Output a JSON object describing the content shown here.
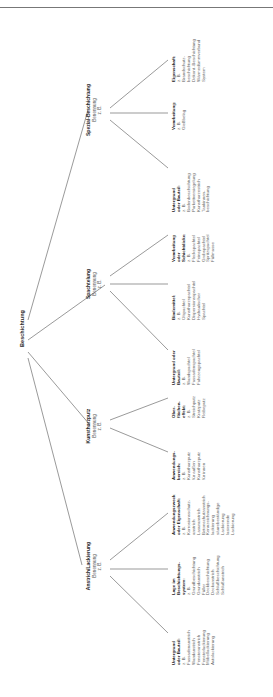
{
  "diagram": {
    "root": "Beschichtung",
    "label_designation": "Benennung",
    "label_eg": "z. B.",
    "categories": [
      {
        "title": "Spezial-Beschichtung",
        "children": [
          {
            "heading": [
              "Untergrund",
              "oder Bauteil:"
            ],
            "items": [
              "Bodenbeschichtung",
              "Parkettversiegelung",
              "Kunstharzestrich",
              "Tankinnen-",
              "beschichtung"
            ]
          },
          {
            "heading": [
              "Verarbeitung:"
            ],
            "items": [
              "Gießbelag"
            ]
          },
          {
            "heading": [
              "Eigenschaft:"
            ],
            "items": [
              "Brandschutz-",
              "beschichtung",
              "Dekont.-Beschichtung",
              "Wärmedämmverbund",
              "System"
            ]
          }
        ]
      },
      {
        "title": "Spachtelung",
        "children": [
          {
            "heading": [
              "Untergrund oder",
              "Bauteil:"
            ],
            "items": [
              "Wandspachtel",
              "Fassadenspachtel",
              "Fahrzeugspachtel"
            ]
          },
          {
            "heading": [
              "Bindemittel:"
            ],
            "items": [
              "Ölspachtel",
              "Kunstharzspachtel",
              "Dispersionsspachtel",
              "Hydraulischer",
              "Spachtel"
            ]
          },
          {
            "heading": [
              "Verarbeitung",
              "oder",
              "Schichtdicke:"
            ],
            "items": [
              "Fleckspachtel",
              "Feinspachtel",
              "Grobspachtel",
              "Spritzspachtel",
              "Füllmasse"
            ]
          }
        ]
      },
      {
        "title": "Kunstharzputz",
        "children": [
          {
            "heading": [
              "Anwendungs-",
              "bereich:"
            ],
            "items": [
              "Kunstharzputz",
              "für außen",
              "Kunstharzputz",
              "für innen"
            ]
          },
          {
            "heading": [
              "Ober-",
              "flächen-",
              "effekt:"
            ],
            "items": [
              "Streichputz",
              "Kratzputz",
              "Reibeputz"
            ]
          }
        ]
      },
      {
        "title": "Anstrich/Lackierung",
        "children": [
          {
            "heading": [
              "Untergrund",
              "oder Bauteil:"
            ],
            "items": [
              "Fassadenanstrich",
              "Wandanstrich",
              "Fensteranstrich",
              "Fensterlackierung",
              "Möbellackierung",
              "Autolackierung"
            ]
          },
          {
            "heading": [
              "Lage im",
              "Beschichtungs-",
              "system:"
            ],
            "items": [
              "Grundbeschichtung",
              "Grundanstrich",
              "Füller",
              "Deckbeschichtung",
              "Deckanstrich",
              "Schlußbeschichtung",
              "Schlußanstrich"
            ]
          },
          {
            "heading": [
              "Anwendungszweck",
              "oder Eigenschaft:"
            ],
            "items": [
              "Korrosionsschutz-",
              "anstrich",
              "Lasuranstrich",
              "Betonschutzanstrich",
              "Kennzeichnungs-",
              "lackierung",
              "säurebeständige",
              "Lackierung",
              "lasierende",
              "Lackierung"
            ]
          }
        ]
      }
    ],
    "colors": {
      "line": "#555555",
      "text": "#2a2a2a",
      "background": "#ffffff"
    }
  }
}
